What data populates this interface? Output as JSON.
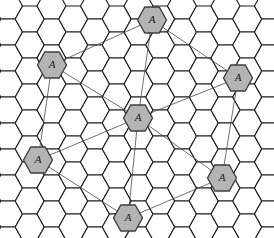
{
  "figure": {
    "type": "hexagonal-cell-grid",
    "background_color": "#ffffff"
  },
  "grid": {
    "orientation": "flat-top",
    "cell_width": 29,
    "cell_height": 26,
    "row_spacing": 19.5,
    "col_spacing": 14.5,
    "rows": 12,
    "cols": 20,
    "stroke_color": "#1a1a1a",
    "stroke_width": 1.1,
    "fill_color": "#ffffff",
    "origin_x": 8,
    "origin_y": 6
  },
  "cells": {
    "shaded_fill": "#b4b4b4",
    "shaded_stroke": "#3c3c3c",
    "label": "A",
    "marked": [
      {
        "id": "cell-top",
        "label": "A",
        "x": 152,
        "y": 20,
        "role": "co-channel"
      },
      {
        "id": "cell-upper-left",
        "label": "A",
        "x": 52,
        "y": 65,
        "role": "co-channel"
      },
      {
        "id": "cell-right",
        "label": "A",
        "x": 238,
        "y": 78,
        "role": "co-channel"
      },
      {
        "id": "cell-center",
        "label": "A",
        "x": 138,
        "y": 118,
        "role": "hub"
      },
      {
        "id": "cell-lower-left",
        "label": "A",
        "x": 38,
        "y": 160,
        "role": "co-channel"
      },
      {
        "id": "cell-lower-right",
        "label": "A",
        "x": 222,
        "y": 178,
        "role": "co-channel"
      },
      {
        "id": "cell-bottom",
        "label": "A",
        "x": 128,
        "y": 218,
        "role": "co-channel"
      }
    ]
  },
  "connections": {
    "stroke_color": "#4a4a4a",
    "stroke_width": 0.8,
    "links": [
      {
        "id": "link-center-top",
        "from": "cell-center",
        "to": "cell-top"
      },
      {
        "id": "link-center-upper-left",
        "from": "cell-center",
        "to": "cell-upper-left"
      },
      {
        "id": "link-center-right",
        "from": "cell-center",
        "to": "cell-right"
      },
      {
        "id": "link-center-lower-left",
        "from": "cell-center",
        "to": "cell-lower-left"
      },
      {
        "id": "link-center-lower-right",
        "from": "cell-center",
        "to": "cell-lower-right"
      },
      {
        "id": "link-center-bottom",
        "from": "cell-center",
        "to": "cell-bottom"
      },
      {
        "id": "link-top-right",
        "from": "cell-top",
        "to": "cell-right"
      },
      {
        "id": "link-top-upper-left",
        "from": "cell-top",
        "to": "cell-upper-left"
      },
      {
        "id": "link-upper-left-lower-left",
        "from": "cell-upper-left",
        "to": "cell-lower-left"
      },
      {
        "id": "link-right-lower-right",
        "from": "cell-right",
        "to": "cell-lower-right"
      },
      {
        "id": "link-lower-left-bottom",
        "from": "cell-lower-left",
        "to": "cell-bottom"
      },
      {
        "id": "link-bottom-lower-right",
        "from": "cell-bottom",
        "to": "cell-lower-right"
      }
    ]
  }
}
